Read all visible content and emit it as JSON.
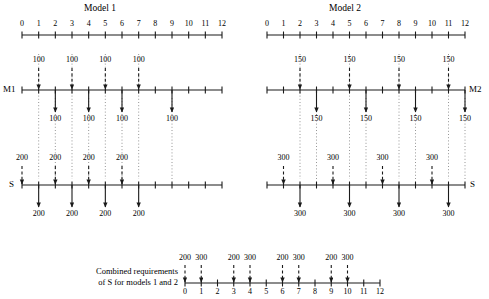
{
  "diagram": {
    "title_model1": "Model  1",
    "title_model2": "Model  2",
    "panels": [
      {
        "id": "model1",
        "title": "Model  1",
        "scale": {
          "min": 0,
          "max": 12,
          "ticks": [
            "0",
            "1",
            "2",
            "3",
            "4",
            "5",
            "6",
            "7",
            "8",
            "9",
            "10",
            "11",
            "12"
          ]
        },
        "machine": {
          "label": "M1",
          "label_side": "left",
          "input_qty": "100",
          "output_qty": "100",
          "input_positions": [
            1,
            3,
            5,
            7
          ],
          "output_positions": [
            2,
            4,
            6,
            9
          ]
        },
        "sub": {
          "label": "S",
          "label_side": "left",
          "input_qty": "200",
          "output_qty": "200",
          "input_positions": [
            0,
            2,
            4,
            6
          ],
          "output_positions": [
            1,
            3,
            5,
            7
          ]
        }
      },
      {
        "id": "model2",
        "title": "Model  2",
        "scale": {
          "min": 0,
          "max": 12,
          "ticks": [
            "0",
            "1",
            "2",
            "3",
            "4",
            "5",
            "6",
            "7",
            "8",
            "9",
            "10",
            "11",
            "12"
          ]
        },
        "machine": {
          "label": "M2",
          "label_side": "right",
          "input_qty": "150",
          "output_qty": "150",
          "input_positions": [
            2,
            5,
            8,
            11
          ],
          "output_positions": [
            3,
            6,
            9,
            12
          ]
        },
        "sub": {
          "label": "S",
          "label_side": "right",
          "input_qty": "300",
          "output_qty": "300",
          "input_positions": [
            1,
            4,
            7,
            10
          ],
          "output_positions": [
            2,
            5,
            8,
            11
          ]
        }
      }
    ],
    "combined": {
      "label_line1": "Combined requirements",
      "label_line2": "of S for models 1 and 2",
      "scale": {
        "min": 0,
        "max": 12,
        "ticks": [
          "0",
          "1",
          "2",
          "3",
          "4",
          "5",
          "6",
          "7",
          "8",
          "9",
          "10",
          "11",
          "12"
        ]
      },
      "arrows": [
        {
          "position": 0,
          "qty": "200"
        },
        {
          "position": 1,
          "qty": "300"
        },
        {
          "position": 3,
          "qty": "200"
        },
        {
          "position": 4,
          "qty": "300"
        },
        {
          "position": 6,
          "qty": "200"
        },
        {
          "position": 7,
          "qty": "300"
        },
        {
          "position": 9,
          "qty": "200"
        },
        {
          "position": 10,
          "qty": "300"
        }
      ]
    },
    "colors": {
      "line": "#1a1a1a",
      "dotted": "#8a8a8a",
      "text": "#000000",
      "background": "#ffffff"
    }
  },
  "chart_data": {
    "type": "table",
    "xlabel": "Time period",
    "ylabel": "",
    "xlim": [
      0,
      12
    ],
    "grid": false,
    "legend": "none",
    "series": [
      {
        "name": "M1 input (100)",
        "x": [
          1,
          3,
          5,
          7
        ],
        "values": [
          100,
          100,
          100,
          100
        ]
      },
      {
        "name": "M1 output (100)",
        "x": [
          2,
          4,
          6,
          9
        ],
        "values": [
          100,
          100,
          100,
          100
        ]
      },
      {
        "name": "S input model 1 (200)",
        "x": [
          0,
          2,
          4,
          6
        ],
        "values": [
          200,
          200,
          200,
          200
        ]
      },
      {
        "name": "S output model 1 (200)",
        "x": [
          1,
          3,
          5,
          7
        ],
        "values": [
          200,
          200,
          200,
          200
        ]
      },
      {
        "name": "M2 input (150)",
        "x": [
          2,
          5,
          8,
          11
        ],
        "values": [
          150,
          150,
          150,
          150
        ]
      },
      {
        "name": "M2 output (150)",
        "x": [
          3,
          6,
          9,
          12
        ],
        "values": [
          150,
          150,
          150,
          150
        ]
      },
      {
        "name": "S input model 2 (300)",
        "x": [
          1,
          4,
          7,
          10
        ],
        "values": [
          300,
          300,
          300,
          300
        ]
      },
      {
        "name": "S output model 2 (300)",
        "x": [
          2,
          5,
          8,
          11
        ],
        "values": [
          300,
          300,
          300,
          300
        ]
      },
      {
        "name": "Combined S requirements",
        "x": [
          0,
          1,
          3,
          4,
          6,
          7,
          9,
          10
        ],
        "values": [
          200,
          300,
          200,
          300,
          200,
          300,
          200,
          300
        ]
      }
    ]
  }
}
